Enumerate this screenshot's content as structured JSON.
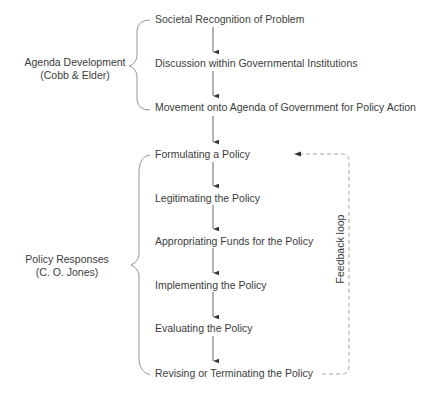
{
  "diagram": {
    "groups": [
      {
        "label": "Agenda Development",
        "sublabel": "(Cobb & Elder)",
        "steps": [
          "Societal Recognition of Problem",
          "Discussion within Governmental Institutions",
          "Movement onto Agenda of Government for Policy Action"
        ]
      },
      {
        "label": "Policy Responses",
        "sublabel": "(C. O. Jones)",
        "steps": [
          "Formulating a Policy",
          "Legitimating the Policy",
          "Appropriating Funds for the Policy",
          "Implementing the Policy",
          "Evaluating the Policy",
          "Revising or Terminating the Policy"
        ]
      }
    ],
    "feedback": {
      "label": "Feedback loop",
      "from": "Revising or Terminating the Policy",
      "to": "Formulating a Policy",
      "style": "dashed"
    },
    "colors": {
      "text": "#3c3c3c",
      "line": "#555555",
      "dashed": "#9a9a9a",
      "background": "#ffffff"
    }
  }
}
